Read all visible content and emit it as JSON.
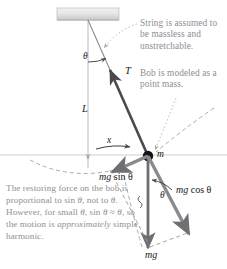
{
  "figure": {
    "colors": {
      "text_note": "#8e8e93",
      "label": "#1a1a1a",
      "vector": "#6e6e73",
      "string": "#8c8c90",
      "bob": "#111111",
      "ceiling": "#d8d8d8",
      "dashed": "#9a9a9e",
      "equilibrium_line": "#b9b9bd"
    },
    "annotations": {
      "string_note": "String is assumed to be massless and unstretchable.",
      "bob_note": "Bob is modeled as a point mass.",
      "restoring_note_part1": "The restoring force on the bob is proportional to sin ",
      "restoring_note_theta1": "θ",
      "restoring_note_part2": ", not to ",
      "restoring_note_theta2": "θ",
      "restoring_note_part3": ". However, for small ",
      "restoring_note_theta3": "θ",
      "restoring_note_part4": ", sin ",
      "restoring_note_theta4": "θ",
      "restoring_note_part5": " ≈ ",
      "restoring_note_theta5": "θ",
      "restoring_note_part6": ", so the motion is ",
      "restoring_note_emph": "approximately",
      "restoring_note_part7": " simple harmonic."
    },
    "labels": {
      "theta_top": "θ",
      "theta_bottom": "θ",
      "length": "L",
      "tension": "T",
      "mass": "m",
      "displacement": "x",
      "mg_sin_theta_pre": "mg",
      "mg_sin_theta_post": " sin θ",
      "mg_cos_theta_pre": "mg",
      "mg_cos_theta_post": " cos θ",
      "weight": "mg"
    },
    "geometry": {
      "pivot": [
        88,
        20
      ],
      "bob": [
        148,
        156
      ],
      "ceiling_rect": [
        57,
        8,
        62,
        12
      ],
      "equilibrium_y": 155,
      "string_length_px": 148,
      "angle_degrees": 24
    }
  }
}
